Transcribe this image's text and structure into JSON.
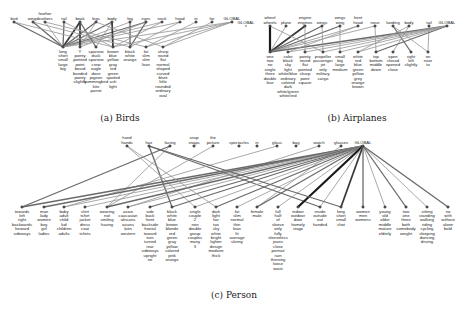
{
  "figures": [
    {
      "caption": "(a) Birds",
      "caption_pos": [
        120,
        121
      ],
      "top_y": 22,
      "bottom_y": 47,
      "top": [
        {
          "x": 14,
          "label": [
            "bird"
          ]
        },
        {
          "x": 33,
          "label": [
            "wings"
          ]
        },
        {
          "x": 45,
          "label": [
            "feather",
            "feathers"
          ]
        },
        {
          "x": 64,
          "label": [
            "tail"
          ]
        },
        {
          "x": 80,
          "label": [
            "beak"
          ]
        },
        {
          "x": 96,
          "label": [
            "legs"
          ]
        },
        {
          "x": 112,
          "label": [
            "body"
          ]
        },
        {
          "x": 130,
          "label": [
            "leg"
          ]
        },
        {
          "x": 146,
          "label": [
            "eyes"
          ]
        },
        {
          "x": 162,
          "label": [
            "neck"
          ]
        },
        {
          "x": 180,
          "label": [
            "head"
          ]
        },
        {
          "x": 196,
          "label": [
            "in"
          ]
        },
        {
          "x": 212,
          "label": [
            "for"
          ]
        },
        {
          "x": 232,
          "label": [
            "GLOBAL"
          ]
        }
      ],
      "bottom": [
        {
          "x": 63,
          "label": [
            "long",
            "short",
            "small",
            "large",
            "big"
          ]
        },
        {
          "x": 80,
          "label": [
            "Y",
            "pointy",
            "pointed",
            "point",
            "beard",
            "banded",
            "pointy",
            "slightly"
          ]
        },
        {
          "x": 96,
          "label": [
            "sparrow",
            "duck",
            "sparrow",
            "crow",
            "eagle",
            "dove",
            "pigeon",
            "hummingbird",
            "kite",
            "parrot"
          ]
        },
        {
          "x": 113,
          "label": [
            "brown",
            "blue",
            "yellow",
            "gray",
            "red",
            "green",
            "spotted",
            "ash",
            "light"
          ]
        },
        {
          "x": 130,
          "label": [
            "black",
            "white",
            "orange"
          ]
        },
        {
          "x": 146,
          "label": [
            "fat",
            "slim",
            "slim",
            "lean"
          ]
        },
        {
          "x": 163,
          "label": [
            "sharp",
            "round",
            "flat",
            "normal",
            "shaped",
            "curved",
            "blunt",
            "little",
            "rounded",
            "ordinary",
            "oval"
          ]
        }
      ],
      "edges": [
        [
          0,
          0,
          2
        ],
        [
          1,
          0,
          2
        ],
        [
          2,
          0,
          1
        ],
        [
          3,
          0,
          2
        ],
        [
          4,
          0,
          3
        ],
        [
          5,
          0,
          2
        ],
        [
          6,
          0,
          2
        ],
        [
          7,
          0,
          1
        ],
        [
          8,
          0,
          2
        ],
        [
          9,
          0,
          1
        ],
        [
          10,
          0,
          1
        ],
        [
          13,
          0,
          1
        ],
        [
          4,
          1,
          3
        ],
        [
          4,
          2,
          2
        ],
        [
          6,
          2,
          1
        ],
        [
          6,
          3,
          3
        ],
        [
          3,
          3,
          1
        ],
        [
          5,
          1,
          1
        ],
        [
          8,
          4,
          2
        ],
        [
          9,
          3,
          1
        ],
        [
          10,
          4,
          1
        ],
        [
          11,
          5,
          1
        ],
        [
          12,
          6,
          1
        ],
        [
          13,
          6,
          1
        ],
        [
          13,
          5,
          1
        ],
        [
          13,
          3,
          1
        ],
        [
          1,
          4,
          1
        ],
        [
          2,
          5,
          1
        ],
        [
          0,
          3,
          1
        ],
        [
          7,
          4,
          2
        ],
        [
          8,
          1,
          1
        ],
        [
          5,
          6,
          1
        ]
      ]
    },
    {
      "caption": "(b) Airplanes",
      "caption_pos": [
        357,
        121
      ],
      "top_y": 26,
      "bottom_y": 52,
      "top": [
        {
          "x": 270,
          "label": [
            "wheel",
            "wheels"
          ]
        },
        {
          "x": 286,
          "label": [
            "plane"
          ]
        },
        {
          "x": 305,
          "label": [
            "engine",
            "engines"
          ]
        },
        {
          "x": 322,
          "label": [
            "wings"
          ]
        },
        {
          "x": 340,
          "label": [
            "wings",
            "wing"
          ]
        },
        {
          "x": 358,
          "label": [
            "front",
            "head"
          ]
        },
        {
          "x": 375,
          "label": [
            "nose"
          ]
        },
        {
          "x": 393,
          "label": [
            "landing"
          ]
        },
        {
          "x": 409,
          "label": [
            "body"
          ]
        },
        {
          "x": 429,
          "label": [
            "tail"
          ]
        },
        {
          "x": 447,
          "label": [
            "GLOBAL"
          ]
        }
      ],
      "extra_left": {
        "x": 246,
        "y": 26,
        "label": "GLOBAL"
      },
      "bottom": [
        {
          "x": 270,
          "label": [
            "one",
            "two",
            "no",
            "single",
            "three",
            "double",
            "four"
          ]
        },
        {
          "x": 288,
          "label": [
            "color",
            "black",
            "sky",
            "light",
            "white/blue",
            "ordinary",
            "colored",
            "dark",
            "white/green",
            "white/red"
          ]
        },
        {
          "x": 305,
          "label": [
            "pointy",
            "round",
            "flat",
            "pointed",
            "sharp",
            "point",
            "square"
          ]
        },
        {
          "x": 323,
          "label": [
            "propeller",
            "passenger",
            "jet",
            "only",
            "military",
            "cargo"
          ]
        },
        {
          "x": 340,
          "label": [
            "small",
            "big",
            "large",
            "medium"
          ]
        },
        {
          "x": 358,
          "label": [
            "white",
            "red",
            "blue",
            "green",
            "yellow",
            "grey",
            "orange",
            "brown"
          ]
        },
        {
          "x": 376,
          "label": [
            "top",
            "bottom",
            "middle",
            "down"
          ]
        },
        {
          "x": 393,
          "label": [
            "open",
            "closed",
            "opened",
            "close"
          ]
        },
        {
          "x": 411,
          "label": [
            "right",
            "left",
            "slightly"
          ]
        },
        {
          "x": 428,
          "label": [
            "on",
            "near",
            "to"
          ]
        }
      ],
      "edges": [
        [
          0,
          0,
          4
        ],
        [
          1,
          0,
          1
        ],
        [
          2,
          0,
          3
        ],
        [
          3,
          0,
          2
        ],
        [
          4,
          0,
          2
        ],
        [
          5,
          0,
          1
        ],
        [
          6,
          0,
          1
        ],
        [
          10,
          0,
          2
        ],
        [
          2,
          2,
          1
        ],
        [
          3,
          3,
          1
        ],
        [
          4,
          4,
          1
        ],
        [
          5,
          1,
          1
        ],
        [
          6,
          6,
          1
        ],
        [
          7,
          8,
          2
        ],
        [
          8,
          7,
          1
        ],
        [
          9,
          9,
          1
        ],
        [
          10,
          1,
          1
        ],
        [
          10,
          2,
          1
        ],
        [
          10,
          3,
          1
        ],
        [
          10,
          4,
          1
        ],
        [
          10,
          6,
          2
        ],
        [
          10,
          5,
          1
        ],
        [
          7,
          9,
          1
        ],
        [
          8,
          5,
          1
        ],
        [
          0,
          3,
          1
        ]
      ]
    },
    {
      "caption": "(c) Person",
      "caption_pos": [
        234,
        298
      ],
      "top_y": 146,
      "bottom_y": 207,
      "top": [
        {
          "x": 127,
          "label": [
            "hand",
            "hands"
          ]
        },
        {
          "x": 149,
          "label": [
            "hair"
          ]
        },
        {
          "x": 170,
          "label": [
            "facing"
          ]
        },
        {
          "x": 194,
          "label": [
            "snap",
            "snaps"
          ]
        },
        {
          "x": 213,
          "label": [
            "the",
            "picture"
          ]
        },
        {
          "x": 239,
          "label": [
            "spectacles"
          ]
        },
        {
          "x": 257,
          "label": [
            "in"
          ]
        },
        {
          "x": 277,
          "label": [
            "glass"
          ]
        },
        {
          "x": 296,
          "label": [
            "bag"
          ]
        },
        {
          "x": 319,
          "label": [
            "watch"
          ]
        },
        {
          "x": 341,
          "label": [
            "glasses"
          ]
        },
        {
          "x": 363,
          "label": [
            "GLOBAL"
          ]
        }
      ],
      "bottom": [
        {
          "x": 22,
          "label": [
            "towards",
            "left",
            "right",
            "backwards",
            "forward",
            "sideways"
          ]
        },
        {
          "x": 44,
          "label": [
            "man",
            "lady",
            "women",
            "boy",
            "girl",
            "ladies"
          ]
        },
        {
          "x": 64,
          "label": [
            "baby",
            "adult",
            "child",
            "kid",
            "children",
            "adults"
          ]
        },
        {
          "x": 85,
          "label": [
            "shirt",
            "tshirt",
            "jacket",
            "dress",
            "coat",
            "tshirts"
          ]
        },
        {
          "x": 107,
          "label": [
            "wearing",
            "not",
            "smiling",
            "having"
          ]
        },
        {
          "x": 128,
          "label": [
            "asian",
            "caucasian",
            "africans",
            "asians",
            "latin",
            "western"
          ]
        },
        {
          "x": 150,
          "label": [
            "side",
            "back",
            "front",
            "backside",
            "frontal",
            "toward",
            "turn",
            "turned",
            "rear",
            "sideways",
            "upright",
            "ne"
          ]
        },
        {
          "x": 172,
          "label": [
            "black",
            "white",
            "blue",
            "brown",
            "blonde",
            "red",
            "green",
            "gray",
            "yellow",
            "colored",
            "pink",
            "orange"
          ]
        },
        {
          "x": 195,
          "label": [
            "single",
            "couple",
            "2",
            "non",
            "double",
            "group",
            "couples",
            "many",
            "3"
          ]
        },
        {
          "x": 216,
          "label": [
            "dark",
            "light",
            "fair",
            "tan",
            "shy",
            "white",
            "bright",
            "lighter",
            "design",
            "medium",
            "thick"
          ]
        },
        {
          "x": 237,
          "label": [
            "fat",
            "slim",
            "normal",
            "thin",
            "lean",
            "fit",
            "average",
            "skinny"
          ]
        },
        {
          "x": 257,
          "label": [
            "female",
            "male"
          ]
        },
        {
          "x": 278,
          "label": [
            "full",
            "half",
            "of",
            "sleeve",
            "only",
            "fully",
            "sleeveless",
            "jeans",
            "close",
            "portrait",
            "rain",
            "thinning",
            "loose",
            "waist"
          ]
        },
        {
          "x": 298,
          "label": [
            "indoor",
            "outdoor",
            "door",
            "homely",
            "stage"
          ]
        },
        {
          "x": 320,
          "label": [
            "inside",
            "outside",
            "out",
            "handed"
          ]
        },
        {
          "x": 341,
          "label": [
            "long",
            "short",
            "small",
            "shot"
          ]
        },
        {
          "x": 363,
          "label": [
            "women",
            "men",
            "womens"
          ]
        },
        {
          "x": 385,
          "label": [
            "young",
            "old",
            "older",
            "middle",
            "mature",
            "elderly"
          ]
        },
        {
          "x": 406,
          "label": [
            "two",
            "one",
            "three",
            "both",
            "somebody",
            "weight"
          ]
        },
        {
          "x": 427,
          "label": [
            "sitting",
            "standing",
            "walking",
            "riding",
            "cycling",
            "sleeping",
            "dancing",
            "driving"
          ]
        },
        {
          "x": 448,
          "label": [
            "no",
            "with",
            "without",
            "alone",
            "bald"
          ]
        }
      ],
      "edges": [
        [
          2,
          0,
          2
        ],
        [
          1,
          7,
          2
        ],
        [
          2,
          4,
          1
        ],
        [
          1,
          14,
          2
        ],
        [
          0,
          8,
          1
        ],
        [
          4,
          4,
          1
        ],
        [
          7,
          2,
          1
        ],
        [
          9,
          5,
          1
        ],
        [
          10,
          11,
          1
        ],
        [
          11,
          0,
          2
        ],
        [
          11,
          1,
          2
        ],
        [
          11,
          2,
          1
        ],
        [
          11,
          3,
          1
        ],
        [
          11,
          4,
          2
        ],
        [
          11,
          5,
          1
        ],
        [
          11,
          6,
          2
        ],
        [
          11,
          7,
          2
        ],
        [
          11,
          8,
          1
        ],
        [
          11,
          9,
          2
        ],
        [
          11,
          10,
          1
        ],
        [
          11,
          11,
          2
        ],
        [
          11,
          12,
          1
        ],
        [
          11,
          13,
          4
        ],
        [
          11,
          14,
          1
        ],
        [
          11,
          15,
          3
        ],
        [
          11,
          16,
          2
        ],
        [
          11,
          17,
          1
        ],
        [
          11,
          18,
          2
        ],
        [
          11,
          19,
          1
        ],
        [
          11,
          20,
          2
        ],
        [
          1,
          15,
          2
        ],
        [
          0,
          9,
          1
        ]
      ]
    }
  ]
}
